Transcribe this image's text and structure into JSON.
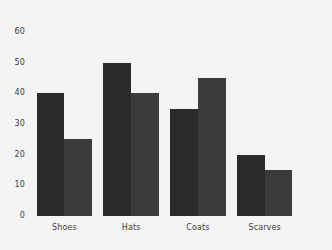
{
  "chart_data": {
    "type": "bar",
    "title": "",
    "subtitle": "",
    "xlabel": "",
    "ylabel": "",
    "categories": [
      "Shoes",
      "Hats",
      "Coats",
      "Scarves"
    ],
    "series": [
      {
        "name": "Series 1",
        "values": [
          40,
          50,
          35,
          20
        ],
        "color": "#2b2b2b"
      },
      {
        "name": "Series 2",
        "values": [
          25,
          40,
          45,
          15
        ],
        "color": "#3b3b3b"
      }
    ],
    "ylim": [
      0,
      60
    ],
    "ytick_labels": [
      "0",
      "10",
      "20",
      "30",
      "40",
      "50",
      "60"
    ],
    "ytick_values": [
      0,
      10,
      20,
      30,
      40,
      50,
      60
    ],
    "grid": false,
    "legend": false,
    "legend_position": "none",
    "background_color": "#f4f4f4",
    "axis_text_color": "#3c3c3c"
  }
}
